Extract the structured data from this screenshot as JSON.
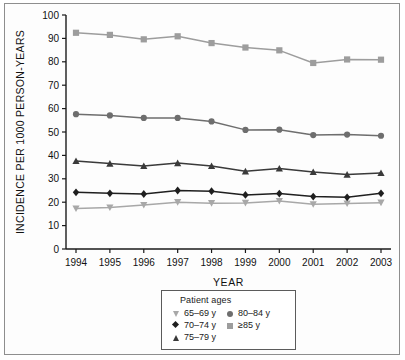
{
  "chart_data": {
    "type": "line",
    "title": "",
    "xlabel": "YEAR",
    "ylabel": "INCIDENCE PER 1000 PERSON-YEARS",
    "categories": [
      "1994",
      "1995",
      "1996",
      "1997",
      "1998",
      "1999",
      "2000",
      "2001",
      "2002",
      "2003"
    ],
    "xticklabels": [
      "1994",
      "1995",
      "1996",
      "1997",
      "1998",
      "1999",
      "2000",
      "2001",
      "2002",
      "2003"
    ],
    "yticklabels": [
      "0",
      "10",
      "20",
      "30",
      "40",
      "50",
      "60",
      "70",
      "80",
      "90",
      "100"
    ],
    "ylim": [
      0,
      100
    ],
    "ytick_step": 10,
    "grid": false,
    "legend_position": "below-axes",
    "legend_title": "Patient ages",
    "series": [
      {
        "name": "65–69 y",
        "marker": "triangle-down",
        "color": "#a8a8a8",
        "values": [
          17.3,
          17.7,
          18.8,
          20.0,
          19.6,
          19.7,
          20.5,
          19.1,
          19.4,
          19.8
        ]
      },
      {
        "name": "70–74 y",
        "marker": "diamond",
        "color": "#1f1f1f",
        "values": [
          24.2,
          23.8,
          23.5,
          25.0,
          24.7,
          23.1,
          23.7,
          22.4,
          22.1,
          23.8
        ]
      },
      {
        "name": "75–79 y",
        "marker": "triangle-up",
        "color": "#3a3a3a",
        "values": [
          37.6,
          36.5,
          35.5,
          36.7,
          35.5,
          33.2,
          34.4,
          32.9,
          31.8,
          32.5
        ]
      },
      {
        "name": "80–84 y",
        "marker": "circle",
        "color": "#6e6e6e",
        "values": [
          57.6,
          57.1,
          56.0,
          56.0,
          54.5,
          50.9,
          51.0,
          48.7,
          48.9,
          48.4
        ]
      },
      {
        "name": "≥85 y",
        "marker": "square",
        "color": "#9d9d9d",
        "values": [
          92.4,
          91.5,
          89.6,
          90.9,
          88.0,
          86.1,
          84.9,
          79.5,
          81.0,
          80.9
        ]
      }
    ]
  },
  "legend": {
    "title": "Patient ages",
    "column_left": [
      {
        "label": "65–69 y",
        "marker": "triangle-down",
        "color": "#a8a8a8"
      },
      {
        "label": "70–74 y",
        "marker": "diamond",
        "color": "#1f1f1f"
      },
      {
        "label": "75–79 y",
        "marker": "triangle-up",
        "color": "#3a3a3a"
      }
    ],
    "column_right": [
      {
        "label": "80–84 y",
        "marker": "circle",
        "color": "#6e6e6e"
      },
      {
        "label": "≥85 y",
        "marker": "square",
        "color": "#9d9d9d"
      }
    ]
  },
  "axes": {
    "x_title": "YEAR",
    "y_title": "INCIDENCE PER 1000 PERSON-YEARS"
  },
  "colors": {
    "frame": "#8e8e8e",
    "axis": "#1a1a1a",
    "background": "#ffffff"
  }
}
